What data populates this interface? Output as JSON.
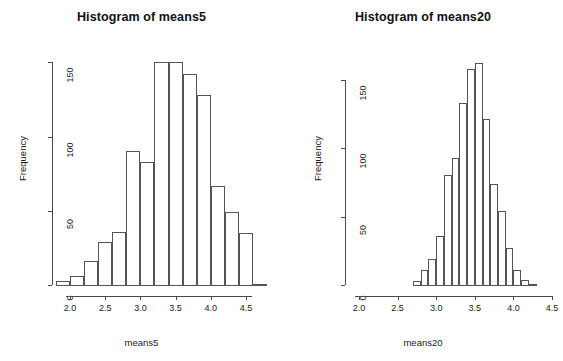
{
  "figure": {
    "background": "#ffffff",
    "ink": "#1a1a1a",
    "axis_color": "#4a4a4a",
    "bar_border": "#555555",
    "bar_fill": "#ffffff"
  },
  "chart_data": [
    {
      "type": "bar",
      "id": "histogram-means5",
      "title": "Histogram of means5",
      "xlabel": "means5",
      "ylabel": "Frequency",
      "xlim": [
        1.78,
        4.78
      ],
      "ylim": [
        0,
        155
      ],
      "xticks": [
        2.0,
        2.5,
        3.0,
        3.5,
        4.0,
        4.5
      ],
      "xtick_labels": [
        "2.0",
        "2.5",
        "3.0",
        "3.5",
        "4.0",
        "4.5"
      ],
      "yticks": [
        0,
        50,
        100,
        150
      ],
      "ytick_labels": [
        "0",
        "50",
        "100",
        "150"
      ],
      "grid": false,
      "legend": "none",
      "bin_width": 0.2,
      "bin_edges": [
        1.8,
        2.0,
        2.2,
        2.4,
        2.6,
        2.8,
        3.0,
        3.2,
        3.4,
        3.6,
        3.8,
        4.0,
        4.2,
        4.4,
        4.6,
        4.8
      ],
      "categories": [
        "1.8-2.0",
        "2.0-2.2",
        "2.2-2.4",
        "2.4-2.6",
        "2.6-2.8",
        "2.8-3.0",
        "3.0-3.2",
        "3.2-3.4",
        "3.4-3.6",
        "3.6-3.8",
        "3.8-4.0",
        "4.0-4.2",
        "4.2-4.4",
        "4.4-4.6",
        "4.6-4.8"
      ],
      "values": [
        3,
        6,
        16,
        29,
        36,
        90,
        83,
        150,
        150,
        142,
        128,
        67,
        49,
        35,
        1
      ]
    },
    {
      "type": "bar",
      "id": "histogram-means20",
      "title": "Histogram of means20",
      "xlabel": "means20",
      "ylabel": "Frequency",
      "xlim": [
        1.95,
        4.6
      ],
      "ylim": [
        0,
        168
      ],
      "xticks": [
        2.0,
        2.5,
        3.0,
        3.5,
        4.0,
        4.5
      ],
      "xtick_labels": [
        "2.0",
        "2.5",
        "3.0",
        "3.5",
        "4.0",
        "4.5"
      ],
      "yticks": [
        0,
        50,
        100,
        150
      ],
      "ytick_labels": [
        "0",
        "50",
        "100",
        "150"
      ],
      "grid": false,
      "legend": "none",
      "bin_width": 0.1,
      "bin_edges": [
        2.7,
        2.8,
        2.9,
        3.0,
        3.1,
        3.2,
        3.3,
        3.4,
        3.5,
        3.6,
        3.7,
        3.8,
        3.9,
        4.0,
        4.1,
        4.2,
        4.3
      ],
      "categories": [
        "2.7-2.8",
        "2.8-2.9",
        "2.9-3.0",
        "3.0-3.1",
        "3.1-3.2",
        "3.2-3.3",
        "3.3-3.4",
        "3.4-3.5",
        "3.5-3.6",
        "3.6-3.7",
        "3.7-3.8",
        "3.8-3.9",
        "3.9-4.0",
        "4.0-4.1",
        "4.1-4.2",
        "4.2-4.3"
      ],
      "values": [
        3,
        11,
        19,
        36,
        80,
        93,
        133,
        158,
        162,
        121,
        74,
        54,
        27,
        11,
        4,
        1
      ]
    }
  ]
}
